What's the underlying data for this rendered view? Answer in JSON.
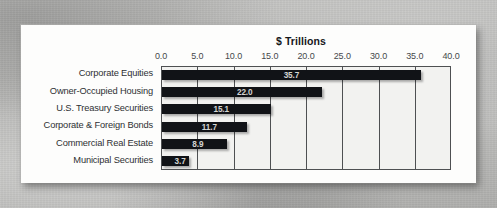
{
  "chart_data": {
    "type": "bar",
    "orientation": "horizontal",
    "title": "$ Trillions",
    "xlabel": "",
    "ylabel": "",
    "xlim": [
      0.0,
      40.0
    ],
    "xticks": [
      "0.0",
      "5.0",
      "10.0",
      "15.0",
      "20.0",
      "25.0",
      "30.0",
      "35.0",
      "40.0"
    ],
    "xtick_values": [
      0,
      5,
      10,
      15,
      20,
      25,
      30,
      35,
      40
    ],
    "grid": true,
    "grid_axis": "x",
    "legend": false,
    "data_labels": true,
    "bar_color": "#111317",
    "plot_background": "#f2f2f0",
    "categories": [
      "Corporate Equities",
      "Owner-Occupied Housing",
      "U.S. Treasury Securities",
      "Corporate & Foreign Bonds",
      "Commercial Real Estate",
      "Municipal Securities"
    ],
    "values": [
      35.7,
      22.0,
      15.1,
      11.7,
      8.9,
      3.7
    ],
    "value_labels": [
      "35.7",
      "22.0",
      "15.1",
      "11.7",
      "8.9",
      "3.7"
    ]
  }
}
